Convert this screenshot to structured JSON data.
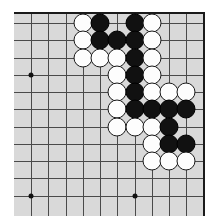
{
  "figure": {
    "board_type": "go-board-corner"
  },
  "board": {
    "background_color": "#d9d9d9",
    "grid_line_color": "#4a4a4a",
    "edge_line_color": "#1a1a1a",
    "black_stone_color": "#111111",
    "white_stone_color": "#fdfdfd",
    "columns": 10,
    "rows": 11,
    "origin_x": 31,
    "origin_y": 23,
    "spacing": 17.25,
    "edge_top_y": 12,
    "edge_right_x": 203,
    "stone_diameter": 19
  },
  "star_points": [
    {
      "name": "star-point-left-upper",
      "col": 0,
      "row": 3
    },
    {
      "name": "star-point-left-lower",
      "col": 0,
      "row": 10
    },
    {
      "name": "star-point-center-lower",
      "col": 6,
      "row": 10
    }
  ],
  "stones": [
    {
      "color": "white",
      "col": 3,
      "row": 0
    },
    {
      "color": "black",
      "col": 4,
      "row": 0
    },
    {
      "color": "black",
      "col": 6,
      "row": 0
    },
    {
      "color": "white",
      "col": 7,
      "row": 0
    },
    {
      "color": "white",
      "col": 3,
      "row": 1
    },
    {
      "color": "black",
      "col": 4,
      "row": 1
    },
    {
      "color": "black",
      "col": 5,
      "row": 1
    },
    {
      "color": "black",
      "col": 6,
      "row": 1
    },
    {
      "color": "white",
      "col": 7,
      "row": 1
    },
    {
      "color": "white",
      "col": 3,
      "row": 2
    },
    {
      "color": "white",
      "col": 4,
      "row": 2
    },
    {
      "color": "white",
      "col": 5,
      "row": 2
    },
    {
      "color": "black",
      "col": 6,
      "row": 2
    },
    {
      "color": "white",
      "col": 7,
      "row": 2
    },
    {
      "color": "white",
      "col": 5,
      "row": 3
    },
    {
      "color": "black",
      "col": 6,
      "row": 3
    },
    {
      "color": "white",
      "col": 7,
      "row": 3
    },
    {
      "color": "white",
      "col": 5,
      "row": 4
    },
    {
      "color": "black",
      "col": 6,
      "row": 4
    },
    {
      "color": "white",
      "col": 7,
      "row": 4
    },
    {
      "color": "white",
      "col": 8,
      "row": 4
    },
    {
      "color": "white",
      "col": 9,
      "row": 4
    },
    {
      "color": "white",
      "col": 5,
      "row": 5
    },
    {
      "color": "black",
      "col": 6,
      "row": 5
    },
    {
      "color": "black",
      "col": 7,
      "row": 5
    },
    {
      "color": "black",
      "col": 8,
      "row": 5
    },
    {
      "color": "black",
      "col": 9,
      "row": 5
    },
    {
      "color": "white",
      "col": 5,
      "row": 6
    },
    {
      "color": "white",
      "col": 6,
      "row": 6
    },
    {
      "color": "white",
      "col": 7,
      "row": 6
    },
    {
      "color": "black",
      "col": 8,
      "row": 6
    },
    {
      "color": "white",
      "col": 7,
      "row": 7
    },
    {
      "color": "black",
      "col": 8,
      "row": 7
    },
    {
      "color": "black",
      "col": 9,
      "row": 7
    },
    {
      "color": "white",
      "col": 7,
      "row": 8
    },
    {
      "color": "white",
      "col": 8,
      "row": 8
    },
    {
      "color": "white",
      "col": 9,
      "row": 8
    }
  ],
  "counts": {
    "black_stones": 16,
    "white_stones": 21,
    "total_stones": 37
  }
}
